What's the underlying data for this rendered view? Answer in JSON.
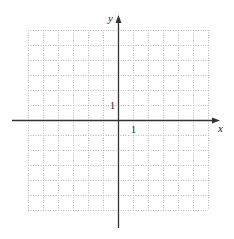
{
  "diagram": {
    "type": "cartesian-grid",
    "x_axis_label": "x",
    "y_axis_label": "y",
    "x_tick_label": "1",
    "y_tick_label": "1",
    "grid": {
      "columns": 12,
      "rows": 12,
      "x_range": [
        -6,
        6
      ],
      "y_range": [
        -6,
        6
      ],
      "line_style": "dotted"
    },
    "colors": {
      "grid": "#b5b5b5",
      "axis": "#333333",
      "text": "#222222"
    }
  }
}
